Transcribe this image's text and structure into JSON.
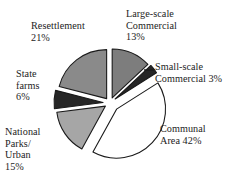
{
  "chart_data": {
    "type": "pie",
    "title": "",
    "subtitle": "",
    "xlabel": "",
    "ylabel": "",
    "grid": false,
    "legend_position": "none",
    "label_format": "name + percent",
    "exploded": true,
    "units": "percent",
    "total": 100,
    "categories": [
      "Large-scale Commercial",
      "Small-scale Commercial",
      "Communal Area",
      "National Parks/Urban",
      "State farms",
      "Resettlement"
    ],
    "values": [
      13,
      3,
      42,
      15,
      6,
      21
    ],
    "slices": [
      {
        "name": "Large-scale Commercial",
        "label_text": "Large-scale\nCommercial\n13%",
        "value": 13,
        "percent": "13%",
        "color": "#7d7d7d",
        "stroke": "#1a1a1a",
        "start_angle": 0,
        "end_angle": 46.8
      },
      {
        "name": "Small-scale Commercial",
        "label_text": "Small-scale\nCommercial 3%",
        "value": 3,
        "percent": "3%",
        "color": "#262626",
        "stroke": "#1a1a1a",
        "start_angle": 46.8,
        "end_angle": 57.6,
        "has_leader_line": true
      },
      {
        "name": "Communal Area",
        "label_text": "Communal\nArea 42%",
        "value": 42,
        "percent": "42%",
        "color": "#ffffff",
        "stroke": "#1a1a1a",
        "start_angle": 57.6,
        "end_angle": 208.8
      },
      {
        "name": "National Parks/Urban",
        "label_text": "National\nParks/\nUrban\n15%",
        "value": 15,
        "percent": "15%",
        "color": "#a6a6a6",
        "stroke": "#1a1a1a",
        "start_angle": 208.8,
        "end_angle": 262.8
      },
      {
        "name": "State farms",
        "label_text": "State\nfarms\n6%",
        "value": 6,
        "percent": "6%",
        "color": "#262626",
        "stroke": "#1a1a1a",
        "start_angle": 262.8,
        "end_angle": 284.4
      },
      {
        "name": "Resettlement",
        "label_text": "Resettlement\n21%",
        "value": 21,
        "percent": "21%",
        "color": "#8a8a8a",
        "stroke": "#1a1a1a",
        "start_angle": 284.4,
        "end_angle": 360
      }
    ]
  },
  "labels": {
    "resettlement": "Resettlement\n21%",
    "large_scale_commercial": "Large-scale\nCommercial\n13%",
    "small_scale_commercial": "Small-scale\nCommercial 3%",
    "communal_area": "Communal\nArea 42%",
    "state_farms": "State\nfarms\n6%",
    "national_parks_urban": "National\nParks/\nUrban\n15%"
  },
  "colors": {
    "background": "#ffffff",
    "outline": "#1a1a1a",
    "text": "#1d1d1d",
    "dark_slice": "#262626",
    "mid_slice": "#8a8a8a",
    "mid_dark_slice": "#7d7d7d",
    "light_slice": "#a6a6a6",
    "white_slice": "#ffffff"
  }
}
